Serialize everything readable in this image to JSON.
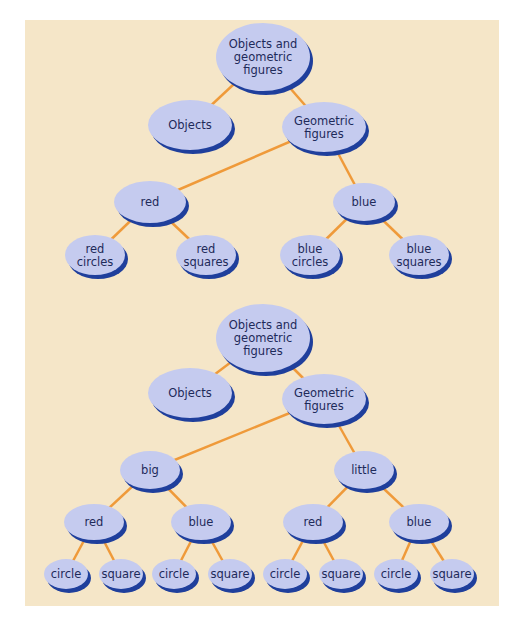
{
  "colors": {
    "background": "#f5e6c8",
    "node_fill": "#c5cbef",
    "node_shadow": "#1f3f9c",
    "edge": "#ef9a3a",
    "text": "#1e2a5a"
  },
  "trees": [
    {
      "name": "tree-color-first",
      "nodes": [
        {
          "id": "root",
          "lines": [
            "Objects and",
            "geometric",
            "figures"
          ],
          "cx": 263,
          "cy": 57,
          "rx": 47,
          "ry": 34
        },
        {
          "id": "objects",
          "lines": [
            "Objects"
          ],
          "cx": 190,
          "cy": 125,
          "rx": 42,
          "ry": 25
        },
        {
          "id": "geometric",
          "lines": [
            "Geometric",
            "figures"
          ],
          "cx": 324,
          "cy": 127,
          "rx": 42,
          "ry": 25
        },
        {
          "id": "red",
          "lines": [
            "red"
          ],
          "cx": 150,
          "cy": 202,
          "rx": 36,
          "ry": 21
        },
        {
          "id": "blue",
          "lines": [
            "blue"
          ],
          "cx": 364,
          "cy": 202,
          "rx": 31,
          "ry": 19
        },
        {
          "id": "red-circles",
          "lines": [
            "red",
            "circles"
          ],
          "cx": 95,
          "cy": 255,
          "rx": 30,
          "ry": 20
        },
        {
          "id": "red-squares",
          "lines": [
            "red",
            "squares"
          ],
          "cx": 206,
          "cy": 255,
          "rx": 30,
          "ry": 20
        },
        {
          "id": "blue-circles",
          "lines": [
            "blue",
            "circles"
          ],
          "cx": 310,
          "cy": 255,
          "rx": 30,
          "ry": 20
        },
        {
          "id": "blue-squares",
          "lines": [
            "blue",
            "squares"
          ],
          "cx": 419,
          "cy": 255,
          "rx": 30,
          "ry": 20
        }
      ],
      "edges": [
        [
          "root",
          "objects"
        ],
        [
          "root",
          "geometric"
        ],
        [
          "geometric",
          "red"
        ],
        [
          "geometric",
          "blue"
        ],
        [
          "red",
          "red-circles"
        ],
        [
          "red",
          "red-squares"
        ],
        [
          "blue",
          "blue-circles"
        ],
        [
          "blue",
          "blue-squares"
        ]
      ]
    },
    {
      "name": "tree-size-first",
      "nodes": [
        {
          "id": "root",
          "lines": [
            "Objects and",
            "geometric",
            "figures"
          ],
          "cx": 263,
          "cy": 338,
          "rx": 47,
          "ry": 34
        },
        {
          "id": "objects",
          "lines": [
            "Objects"
          ],
          "cx": 190,
          "cy": 393,
          "rx": 42,
          "ry": 25
        },
        {
          "id": "geometric",
          "lines": [
            "Geometric",
            "figures"
          ],
          "cx": 324,
          "cy": 399,
          "rx": 42,
          "ry": 25
        },
        {
          "id": "big",
          "lines": [
            "big"
          ],
          "cx": 150,
          "cy": 470,
          "rx": 30,
          "ry": 19
        },
        {
          "id": "little",
          "lines": [
            "little"
          ],
          "cx": 364,
          "cy": 470,
          "rx": 30,
          "ry": 19
        },
        {
          "id": "big-red",
          "lines": [
            "red"
          ],
          "cx": 94,
          "cy": 522,
          "rx": 30,
          "ry": 18
        },
        {
          "id": "big-blue",
          "lines": [
            "blue"
          ],
          "cx": 201,
          "cy": 522,
          "rx": 30,
          "ry": 18
        },
        {
          "id": "little-red",
          "lines": [
            "red"
          ],
          "cx": 313,
          "cy": 522,
          "rx": 30,
          "ry": 18
        },
        {
          "id": "little-blue",
          "lines": [
            "blue"
          ],
          "cx": 419,
          "cy": 522,
          "rx": 30,
          "ry": 18
        },
        {
          "id": "big-red-circle",
          "lines": [
            "circle"
          ],
          "cx": 66,
          "cy": 574,
          "rx": 22,
          "ry": 15
        },
        {
          "id": "big-red-square",
          "lines": [
            "square"
          ],
          "cx": 121,
          "cy": 574,
          "rx": 22,
          "ry": 15
        },
        {
          "id": "big-blue-circle",
          "lines": [
            "circle"
          ],
          "cx": 174,
          "cy": 574,
          "rx": 22,
          "ry": 15
        },
        {
          "id": "big-blue-square",
          "lines": [
            "square"
          ],
          "cx": 230,
          "cy": 574,
          "rx": 22,
          "ry": 15
        },
        {
          "id": "little-red-circle",
          "lines": [
            "circle"
          ],
          "cx": 285,
          "cy": 574,
          "rx": 22,
          "ry": 15
        },
        {
          "id": "little-red-square",
          "lines": [
            "square"
          ],
          "cx": 341,
          "cy": 574,
          "rx": 22,
          "ry": 15
        },
        {
          "id": "little-blue-circle",
          "lines": [
            "circle"
          ],
          "cx": 396,
          "cy": 574,
          "rx": 22,
          "ry": 15
        },
        {
          "id": "little-blue-square",
          "lines": [
            "square"
          ],
          "cx": 452,
          "cy": 574,
          "rx": 22,
          "ry": 15
        }
      ],
      "edges": [
        [
          "root",
          "objects"
        ],
        [
          "root",
          "geometric"
        ],
        [
          "geometric",
          "big"
        ],
        [
          "geometric",
          "little"
        ],
        [
          "big",
          "big-red"
        ],
        [
          "big",
          "big-blue"
        ],
        [
          "little",
          "little-red"
        ],
        [
          "little",
          "little-blue"
        ],
        [
          "big-red",
          "big-red-circle"
        ],
        [
          "big-red",
          "big-red-square"
        ],
        [
          "big-blue",
          "big-blue-circle"
        ],
        [
          "big-blue",
          "big-blue-square"
        ],
        [
          "little-red",
          "little-red-circle"
        ],
        [
          "little-red",
          "little-red-square"
        ],
        [
          "little-blue",
          "little-blue-circle"
        ],
        [
          "little-blue",
          "little-blue-square"
        ]
      ]
    }
  ]
}
